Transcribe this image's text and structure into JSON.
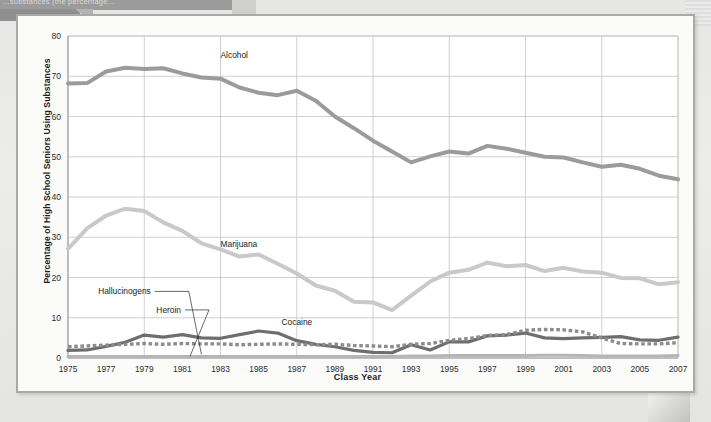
{
  "banner": {
    "text": "...substances (the percentage..."
  },
  "figure": {
    "title": ""
  },
  "chart_data": {
    "type": "line",
    "title": "",
    "xlabel": "Class Year",
    "ylabel": "Percentage of High School Seniors Using Substances",
    "xlim": [
      1975,
      2007
    ],
    "ylim": [
      0,
      80
    ],
    "ytick_step": 10,
    "yticks": [
      "0",
      "10",
      "20",
      "30",
      "40",
      "50",
      "60",
      "70",
      "80"
    ],
    "xticks": [
      "1975",
      "1977",
      "1979",
      "1981",
      "1983",
      "1985",
      "1987",
      "1989",
      "1991",
      "1993",
      "1995",
      "1997",
      "1999",
      "2001",
      "2003",
      "2005",
      "2007"
    ],
    "grid": true,
    "legend_position": "inline-annotations",
    "x": [
      1975,
      1976,
      1977,
      1978,
      1979,
      1980,
      1981,
      1982,
      1983,
      1984,
      1985,
      1986,
      1987,
      1988,
      1989,
      1990,
      1991,
      1992,
      1993,
      1994,
      1995,
      1996,
      1997,
      1998,
      1999,
      2000,
      2001,
      2002,
      2003,
      2004,
      2005,
      2006,
      2007
    ],
    "series": [
      {
        "name": "Alcohol",
        "color": "#9b9b9b",
        "style": "solid",
        "width": 4,
        "label_x": 1983,
        "label_y": 74.5,
        "values": [
          68.2,
          68.3,
          71.2,
          72.1,
          71.8,
          72.0,
          70.7,
          69.7,
          69.4,
          67.2,
          65.9,
          65.3,
          66.4,
          63.9,
          60.0,
          57.1,
          54.0,
          51.3,
          48.6,
          50.1,
          51.3,
          50.8,
          52.7,
          52.0,
          51.0,
          50.0,
          49.8,
          48.6,
          47.5,
          48.0,
          47.0,
          45.3,
          44.4
        ]
      },
      {
        "name": "Marijuana",
        "color": "#c9c9c7",
        "style": "solid",
        "width": 4,
        "label_x": 1983,
        "label_y": 27.5,
        "values": [
          27.1,
          32.2,
          35.4,
          37.1,
          36.5,
          33.7,
          31.6,
          28.5,
          27.0,
          25.2,
          25.7,
          23.4,
          21.0,
          18.0,
          16.7,
          14.0,
          13.8,
          11.9,
          15.5,
          19.0,
          21.2,
          21.9,
          23.7,
          22.8,
          23.1,
          21.6,
          22.4,
          21.5,
          21.2,
          19.9,
          19.8,
          18.3,
          18.8
        ]
      },
      {
        "name": "Cocaine",
        "color": "#6e6e6e",
        "style": "solid",
        "width": 3.2,
        "label_x": 1986.2,
        "label_y": 8.2,
        "values": [
          1.9,
          2.0,
          2.9,
          3.9,
          5.7,
          5.2,
          5.8,
          5.0,
          4.9,
          5.8,
          6.7,
          6.2,
          4.3,
          3.4,
          2.8,
          1.9,
          1.4,
          1.3,
          3.3,
          2.0,
          4.0,
          4.0,
          5.5,
          5.7,
          6.2,
          5.0,
          4.8,
          5.0,
          5.1,
          5.3,
          4.5,
          4.4,
          5.2
        ]
      },
      {
        "name": "Hallucinogens",
        "color": "#8c8c8c",
        "style": "dotted",
        "width": 3.4,
        "label_x": 1976.3,
        "label_y": 15.8,
        "values": [
          2.8,
          3.0,
          3.2,
          3.4,
          3.6,
          3.4,
          3.6,
          3.5,
          3.5,
          3.3,
          3.4,
          3.5,
          3.4,
          3.3,
          3.4,
          3.1,
          3.0,
          2.8,
          3.4,
          3.6,
          4.4,
          4.8,
          5.6,
          5.8,
          6.9,
          7.1,
          7.0,
          6.5,
          5.0,
          3.6,
          3.5,
          3.5,
          3.8
        ]
      },
      {
        "name": "Heroin",
        "color": "#b5b5b5",
        "style": "solid",
        "width": 3,
        "label_x": 1978.2,
        "label_y": 11.2,
        "values": [
          0.4,
          0.4,
          0.4,
          0.4,
          0.4,
          0.4,
          0.4,
          0.4,
          0.4,
          0.4,
          0.4,
          0.4,
          0.4,
          0.4,
          0.4,
          0.4,
          0.4,
          0.4,
          0.5,
          0.5,
          0.6,
          0.6,
          0.6,
          0.6,
          0.6,
          0.7,
          0.7,
          0.6,
          0.5,
          0.5,
          0.5,
          0.5,
          0.6
        ]
      }
    ],
    "annotations": [
      {
        "name": "Hallucinogens",
        "leader_to_x": 1982.0,
        "leader_to_y": 0.9
      },
      {
        "name": "Heroin",
        "leader_to_x": 1981.4,
        "leader_to_y": 0.4
      }
    ]
  }
}
